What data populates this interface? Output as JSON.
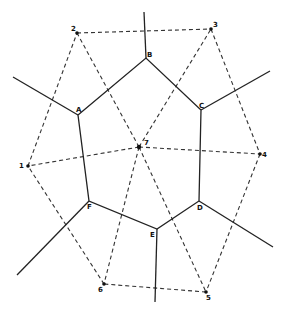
{
  "diagram": {
    "type": "voronoi-delaunay",
    "sites": [
      {
        "id": "1",
        "label": "1",
        "x": 28,
        "y": 166
      },
      {
        "id": "2",
        "label": "2",
        "x": 77,
        "y": 33
      },
      {
        "id": "3",
        "label": "3",
        "x": 211,
        "y": 29
      },
      {
        "id": "4",
        "label": "4",
        "x": 260,
        "y": 154
      },
      {
        "id": "5",
        "label": "5",
        "x": 206,
        "y": 292
      },
      {
        "id": "6",
        "label": "6",
        "x": 104,
        "y": 284
      },
      {
        "id": "7",
        "label": "7",
        "x": 139,
        "y": 147
      }
    ],
    "vertices": [
      {
        "id": "A",
        "label": "A",
        "x": 78,
        "y": 115
      },
      {
        "id": "B",
        "label": "B",
        "x": 146,
        "y": 58
      },
      {
        "id": "C",
        "label": "C",
        "x": 201,
        "y": 110
      },
      {
        "id": "D",
        "label": "D",
        "x": 199,
        "y": 201
      },
      {
        "id": "E",
        "label": "E",
        "x": 157,
        "y": 229
      },
      {
        "id": "F",
        "label": "F",
        "x": 89,
        "y": 201
      }
    ]
  }
}
